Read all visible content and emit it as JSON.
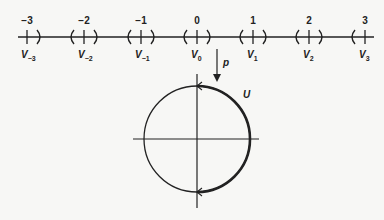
{
  "diagram": {
    "type": "covering-space-diagram",
    "number_line": {
      "ticks": [
        {
          "value": "−3",
          "set_label": "V",
          "set_sub": "−3",
          "x": 27
        },
        {
          "value": "−2",
          "set_label": "V",
          "set_sub": "−2",
          "x": 84
        },
        {
          "value": "−1",
          "set_label": "V",
          "set_sub": "−1",
          "x": 141
        },
        {
          "value": "0",
          "set_label": "V",
          "set_sub": "0",
          "x": 197
        },
        {
          "value": "1",
          "set_label": "V",
          "set_sub": "1",
          "x": 253
        },
        {
          "value": "2",
          "set_label": "V",
          "set_sub": "2",
          "x": 309
        },
        {
          "value": "3",
          "set_label": "V",
          "set_sub": "3",
          "x": 365
        }
      ]
    },
    "map_arrow": {
      "label": "p"
    },
    "circle": {
      "arc_label": "U"
    },
    "colors": {
      "ink": "#222222",
      "background": "#f7f7f5"
    }
  }
}
